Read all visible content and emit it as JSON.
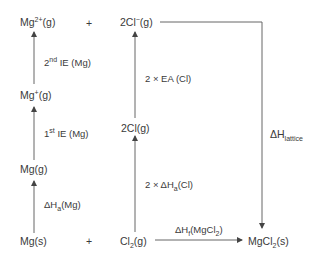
{
  "diagram": {
    "type": "Born-Haber cycle",
    "species": {
      "mg2plus": {
        "base": "Mg",
        "sup": "2+",
        "state": "(g)"
      },
      "plus_top": "+",
      "cl_minus": {
        "base": "2Cl",
        "sup": "−",
        "state": "(g)"
      },
      "mgplus": {
        "base": "Mg",
        "sup": "+",
        "state": "(g)"
      },
      "two_cl": "2Cl(g)",
      "mg_g": "Mg(g)",
      "mg_s": "Mg(s)",
      "plus_bottom": "+",
      "cl2": {
        "base": "Cl",
        "sub": "2",
        "state": "(g)"
      },
      "mgcl2": {
        "base": "MgCl",
        "sub": "2",
        "state": "(s)"
      }
    },
    "steps": {
      "ie2": {
        "prefix": "2",
        "sup": "nd",
        "text": " IE (Mg)"
      },
      "ie1": {
        "prefix": "1",
        "sup": "st",
        "text": " IE (Mg)"
      },
      "atom_mg": {
        "prefix": "ΔH",
        "sub": "a",
        "text": "(Mg)"
      },
      "ea_cl": "2 × EA (Cl)",
      "atom_cl": {
        "prefix": "2 × ΔH",
        "sub": "a",
        "text": "(Cl)"
      },
      "lattice": {
        "prefix": "ΔH",
        "sub": "lattice"
      },
      "formation": {
        "prefix": "ΔH",
        "sub": "f",
        "text": "(MgCl",
        "sub2": "2",
        "end": ")"
      }
    },
    "colors": {
      "line": "#555555",
      "text": "#3a3a3a"
    }
  }
}
